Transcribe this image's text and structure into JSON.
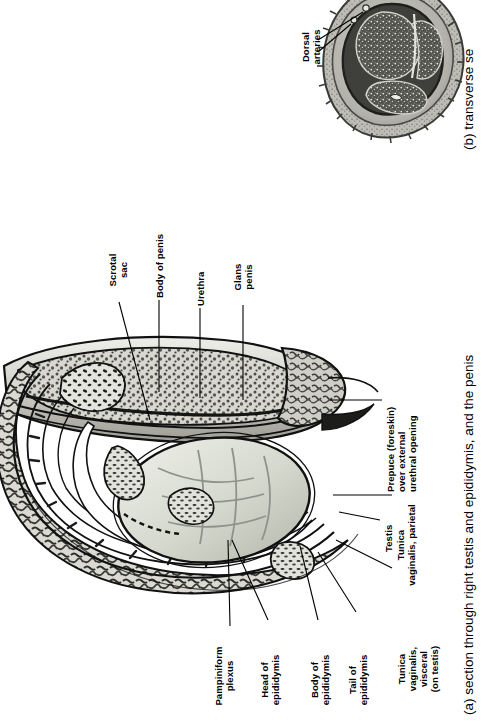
{
  "figure": {
    "orientation": "rotated-90-ccw",
    "panels": [
      {
        "id": "a",
        "caption": "(a) section through right testis and epididymis, and the penis",
        "type": "line-drawing",
        "labels": [
          "Scrotal sac",
          "Body of penis",
          "Urethra",
          "Glans penis",
          "Prepuce (foreskin) over external urethral opening",
          "Tunica vaginalis, parietal",
          "Testis",
          "Tunica vaginalis, visceral (on testis)",
          "Tail of epididymis",
          "Body of epididymis",
          "Head of epididymis",
          "Pampiniform plexus"
        ]
      },
      {
        "id": "b",
        "caption": "(b) transverse se",
        "type": "photomicrograph",
        "labels": [
          "Dorsal arteries"
        ]
      }
    ]
  },
  "panel_a": {
    "label_scrotal_sac_l1": "Scrotal",
    "label_scrotal_sac_l2": "sac",
    "label_body_of_penis": "Body of penis",
    "label_urethra": "Urethra",
    "label_glans_l1": "Glans",
    "label_glans_l2": "penis",
    "label_prepuce_l1": "Prepuce (foreskin)",
    "label_prepuce_l2": "over external",
    "label_prepuce_l3": "urethral opening",
    "label_tv_parietal_l1": "Tunica",
    "label_tv_parietal_l2": "vaginalis, parietal",
    "label_testis": "Testis",
    "label_tv_visceral_l1": "Tunica",
    "label_tv_visceral_l2": "vaginalis,",
    "label_tv_visceral_l3": "visceral",
    "label_tv_visceral_l4": "(on testis)",
    "label_tail_epi_l1": "Tail of",
    "label_tail_epi_l2": "epididymis",
    "label_body_epi_l1": "Body of",
    "label_body_epi_l2": "epididymis",
    "label_head_epi_l1": "Head of",
    "label_head_epi_l2": "epididymis",
    "label_pampiniform_l1": "Pampiniform",
    "label_pampiniform_l2": "plexus",
    "caption": "(a) section through right testis and epididymis, and the penis"
  },
  "panel_b": {
    "label_dorsal_arteries_l1": "Dorsal",
    "label_dorsal_arteries_l2": "arteries",
    "caption": "(b) transverse se"
  },
  "colors": {
    "ink": "#000000",
    "paper": "#ffffff",
    "tissue_light": "#dcdcd6",
    "tissue_mid": "#b9b9b2",
    "tissue_dark": "#6e6e68",
    "photo_dark": "#4a4a47",
    "photo_mid": "#8d8d88",
    "photo_light": "#c8c8c2"
  }
}
